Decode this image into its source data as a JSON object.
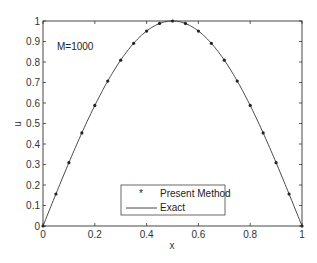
{
  "chart_data": {
    "type": "line",
    "title": "",
    "xlabel": "x",
    "ylabel": "u",
    "xlim": [
      0,
      1
    ],
    "ylim": [
      0,
      1
    ],
    "grid": false,
    "legend_position": "lower center",
    "annotation": "M=1000",
    "xticks": [
      "0",
      "0.2",
      "0.4",
      "0.6",
      "0.8",
      "1"
    ],
    "yticks": [
      "0",
      "0.1",
      "0.2",
      "0.3",
      "0.4",
      "0.5",
      "0.6",
      "0.7",
      "0.8",
      "0.9",
      "1"
    ],
    "series": [
      {
        "name": "Present Method",
        "style": "markers",
        "marker": "*",
        "x": [
          0,
          0.05,
          0.1,
          0.15,
          0.2,
          0.25,
          0.3,
          0.35,
          0.4,
          0.45,
          0.5,
          0.55,
          0.6,
          0.65,
          0.7,
          0.75,
          0.8,
          0.85,
          0.9,
          0.95,
          1.0
        ],
        "values": [
          0,
          0.156,
          0.309,
          0.454,
          0.588,
          0.707,
          0.809,
          0.891,
          0.951,
          0.988,
          1.0,
          0.988,
          0.951,
          0.891,
          0.809,
          0.707,
          0.588,
          0.454,
          0.309,
          0.156,
          0
        ]
      },
      {
        "name": "Exact",
        "style": "solid line",
        "function": "sin(pi*x)",
        "x": [
          0,
          0.05,
          0.1,
          0.15,
          0.2,
          0.25,
          0.3,
          0.35,
          0.4,
          0.45,
          0.5,
          0.55,
          0.6,
          0.65,
          0.7,
          0.75,
          0.8,
          0.85,
          0.9,
          0.95,
          1.0
        ],
        "values": [
          0,
          0.156,
          0.309,
          0.454,
          0.588,
          0.707,
          0.809,
          0.891,
          0.951,
          0.988,
          1.0,
          0.988,
          0.951,
          0.891,
          0.809,
          0.707,
          0.588,
          0.454,
          0.309,
          0.156,
          0
        ]
      }
    ]
  },
  "colors": {
    "axis": "#333333",
    "line": "#333333",
    "marker": "#222222"
  }
}
